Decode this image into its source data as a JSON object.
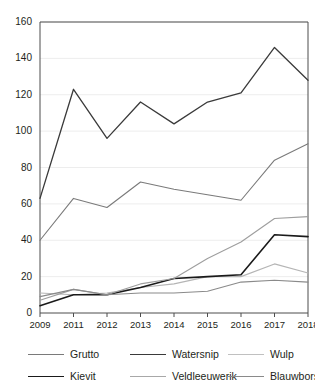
{
  "chart_data": {
    "type": "line",
    "title": "",
    "xlabel": "",
    "ylabel": "",
    "categories": [
      "2009",
      "2011",
      "2012",
      "2013",
      "2014",
      "2015",
      "2016",
      "2017",
      "2018"
    ],
    "x": [
      2009,
      2011,
      2012,
      2013,
      2014,
      2015,
      2016,
      2017,
      2018
    ],
    "ylim": [
      0,
      160
    ],
    "yticks": [
      0,
      20,
      40,
      60,
      80,
      100,
      120,
      140,
      160
    ],
    "grid": true,
    "grid_axis": "y",
    "legend_position": "bottom",
    "legend_columns": 3,
    "series": [
      {
        "name": "Grutto",
        "color": "#7a7a7a",
        "line_width": 1.1,
        "values": [
          40,
          63,
          58,
          72,
          68,
          65,
          62,
          84,
          93
        ]
      },
      {
        "name": "Watersnip",
        "color": "#3a3a3a",
        "line_width": 1.3,
        "values": [
          63,
          123,
          96,
          116,
          104,
          116,
          121,
          146,
          128
        ]
      },
      {
        "name": "Wulp",
        "color": "#b5b5b5",
        "line_width": 1.1,
        "values": [
          11,
          10,
          11,
          14,
          16,
          20,
          20,
          27,
          22
        ]
      },
      {
        "name": "Kievit",
        "color": "#1a1a1a",
        "line_width": 1.6,
        "values": [
          4,
          10,
          10,
          14,
          19,
          20,
          21,
          43,
          42
        ]
      },
      {
        "name": "Veldleeuwerik",
        "color": "#9e9e9e",
        "line_width": 1.1,
        "values": [
          7,
          13,
          10,
          16,
          19,
          30,
          39,
          52,
          53
        ]
      },
      {
        "name": "Blauwborst",
        "color": "#8a8a8a",
        "line_width": 1.1,
        "values": [
          9,
          13,
          10,
          11,
          11,
          12,
          17,
          18,
          17
        ]
      }
    ]
  },
  "axes": {
    "y_tick_labels": [
      "160",
      "140",
      "120",
      "100",
      "80",
      "60",
      "40",
      "20",
      "0"
    ],
    "x_tick_labels": [
      "2009",
      "2011",
      "2012",
      "2013",
      "2014",
      "2015",
      "2016",
      "2017",
      "2018"
    ]
  },
  "legend": {
    "rows": [
      [
        {
          "label": "Grutto",
          "color": "#7a7a7a",
          "width": 1.1
        },
        {
          "label": "Watersnip",
          "color": "#3a3a3a",
          "width": 1.7
        },
        {
          "label": "Wulp",
          "color": "#c0c0c0",
          "width": 1.1
        }
      ],
      [
        {
          "label": "Kievit",
          "color": "#1a1a1a",
          "width": 1.9
        },
        {
          "label": "Veldleeuwerik",
          "color": "#a8a8a8",
          "width": 1.1
        },
        {
          "label": "Blauwborst",
          "color": "#8a8a8a",
          "width": 1.1
        }
      ]
    ]
  },
  "style": {
    "axis_color": "#4d4d4d",
    "grid_color": "#ededed",
    "text_color": "#231f20",
    "background": "#ffffff"
  }
}
